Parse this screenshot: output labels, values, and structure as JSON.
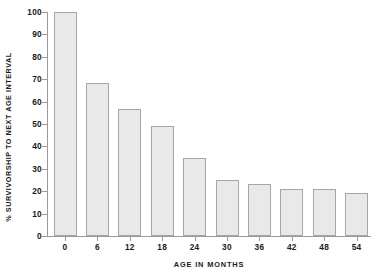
{
  "chart_data": {
    "type": "bar",
    "title": "",
    "subtitle": "",
    "xlabel": "AGE IN MONTHS",
    "ylabel": "% SURVIVORSHIP TO NEXT AGE INTERVAL",
    "categories": [
      "0",
      "6",
      "12",
      "18",
      "24",
      "30",
      "36",
      "42",
      "48",
      "54"
    ],
    "values": [
      100,
      68.5,
      56.5,
      49,
      35,
      25,
      23,
      21,
      21,
      19
    ],
    "ylim": [
      0,
      100
    ],
    "y_ticks": [
      0,
      10,
      20,
      30,
      40,
      50,
      60,
      70,
      80,
      90,
      100
    ],
    "y_tick_labels": [
      "0",
      "10",
      "20",
      "30",
      "40",
      "50",
      "60",
      "70",
      "80",
      "90",
      "100"
    ],
    "grid": false,
    "legend": null,
    "legend_position": "none",
    "annotations": [],
    "colors": {
      "bar_fill": "#e9e9e9",
      "bar_border": "#a6a6a6",
      "axis": "#9a9a9a",
      "text": "#1a1a1a",
      "background": "#ffffff"
    }
  }
}
